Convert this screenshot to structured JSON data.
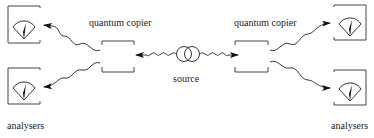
{
  "diagram": {
    "labels": {
      "copier_left": "quantum copier",
      "copier_right": "quantum copier",
      "source": "source",
      "analysers_left": "analysers",
      "analysers_right": "analysers"
    },
    "nodes": [
      {
        "id": "source",
        "type": "source",
        "icon": "entangled-source-icon"
      },
      {
        "id": "copier-left",
        "type": "quantum-copier"
      },
      {
        "id": "copier-right",
        "type": "quantum-copier"
      },
      {
        "id": "analyser-left-top",
        "type": "analyser",
        "icon": "meter-gauge-icon"
      },
      {
        "id": "analyser-left-bottom",
        "type": "analyser",
        "icon": "meter-gauge-icon"
      },
      {
        "id": "analyser-right-top",
        "type": "analyser",
        "icon": "meter-gauge-icon"
      },
      {
        "id": "analyser-right-bottom",
        "type": "analyser",
        "icon": "meter-gauge-icon"
      }
    ],
    "edges": [
      {
        "from": "source",
        "to": "copier-left",
        "style": "wavy-arrow"
      },
      {
        "from": "source",
        "to": "copier-right",
        "style": "wavy-arrow"
      },
      {
        "from": "copier-left",
        "to": "analyser-left-top",
        "style": "wavy-arrow"
      },
      {
        "from": "copier-left",
        "to": "analyser-left-bottom",
        "style": "wavy-arrow"
      },
      {
        "from": "copier-right",
        "to": "analyser-right-top",
        "style": "wavy-arrow"
      },
      {
        "from": "copier-right",
        "to": "analyser-right-bottom",
        "style": "wavy-arrow"
      }
    ],
    "colors": {
      "stroke": "#333333",
      "background": "#ffffff"
    }
  }
}
